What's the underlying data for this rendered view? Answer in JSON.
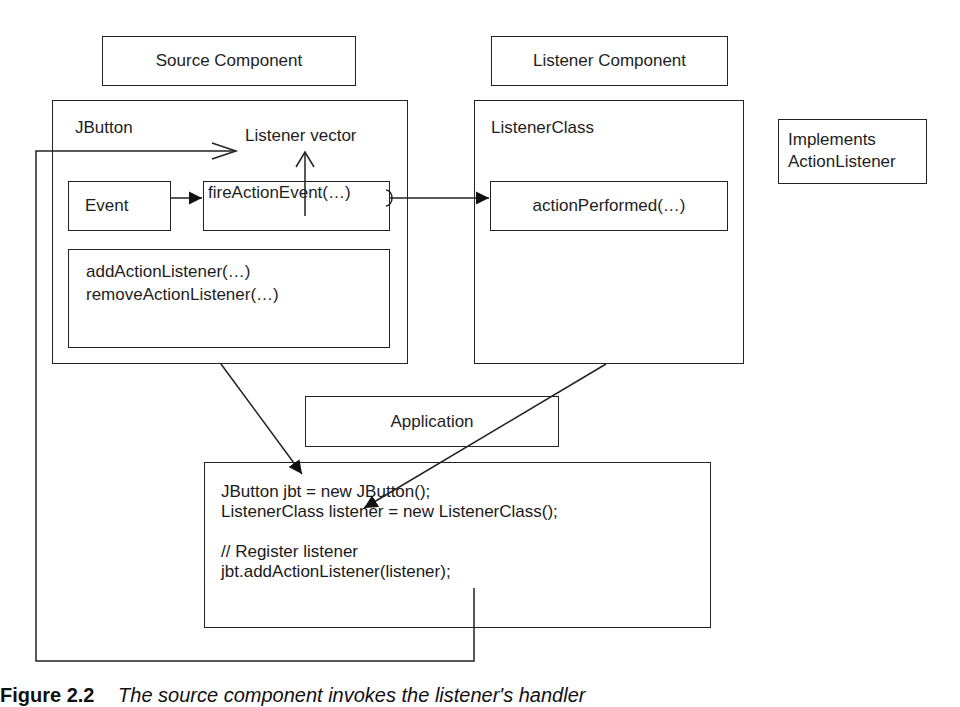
{
  "diagram": {
    "headers": {
      "source": "Source Component",
      "listener": "Listener Component",
      "application": "Application",
      "implements_line1": "Implements",
      "implements_line2": "ActionListener"
    },
    "source_component": {
      "title": "JButton",
      "listener_vector": "Listener vector",
      "event": "Event",
      "fire_method": "fireActionEvent(…)",
      "methods": [
        "addActionListener(…)",
        "removeActionListener(…)"
      ]
    },
    "listener_component": {
      "title": "ListenerClass",
      "handler": "actionPerformed(…)"
    },
    "application_code": [
      "JButton jbt = new JButton();",
      "ListenerClass listener = new ListenerClass();",
      "",
      "// Register listener",
      "jbt.addActionListener(listener);"
    ],
    "caption": {
      "figure": "Figure 2.2",
      "text": "The source component invokes the listener's handler"
    },
    "colors": {
      "stroke": "#222222",
      "background": "#ffffff"
    }
  }
}
